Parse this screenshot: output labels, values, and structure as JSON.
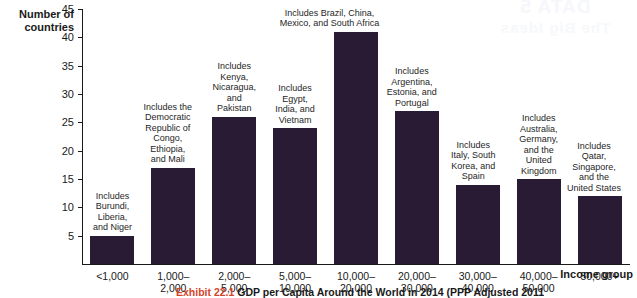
{
  "watermark": {
    "line1": "DATA 5",
    "line2": "The Big Ideas"
  },
  "caption": {
    "exhibit": "Exhibit 22.1",
    "title": "GDP per Capita Around the World in 2014 (PPP Adjusted 2011"
  },
  "chart_data": {
    "type": "bar",
    "title": "",
    "xlabel": "Income group",
    "ylabel": "Number of countries",
    "ylim": [
      0,
      45
    ],
    "yticks": [
      5,
      10,
      15,
      20,
      25,
      30,
      35,
      40,
      45
    ],
    "grid": false,
    "legend": "none",
    "bar_color": "#2a1b35",
    "categories": [
      "<1,000",
      "1,000–\n2,000",
      "2,000–\n5,000",
      "5,000–\n10,000",
      "10,000–\n20,000",
      "20,000–\n30,000",
      "30,000–\n40,000",
      "40,000–\n50,000",
      "50,000+"
    ],
    "values": [
      5,
      17,
      26,
      24,
      41,
      27,
      14,
      15,
      12
    ],
    "annotations": [
      "Includes\nBurundi,\nLiberia,\nand Niger",
      "Includes the\nDemocratic\nRepublic of\nCongo,\nEthiopia,\nand Mali",
      "Includes\nKenya,\nNicaragua,\nand\nPakistan",
      "Includes\nEgypt,\nIndia, and\nVietnam",
      "Includes Brazil, China,\nMexico, and South Africa",
      "Includes\nArgentina,\nEstonia, and\nPortugal",
      "Includes\nItaly, South\nKorea, and\nSpain",
      "Includes\nAustralia,\nGermany,\nand the\nUnited\nKingdom",
      "Includes\nQatar,\nSingapore,\nand the\nUnited States"
    ]
  }
}
